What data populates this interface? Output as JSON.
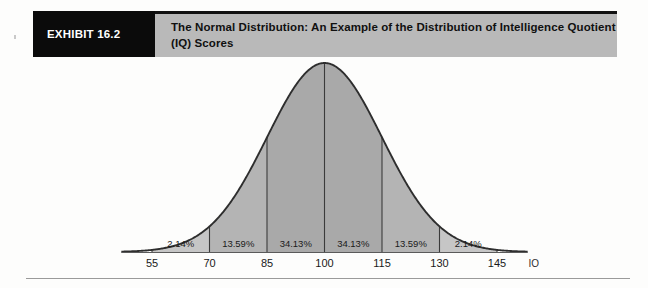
{
  "header": {
    "exhibit_tag": "EXHIBIT 16.2",
    "title": "The Normal Distribution: An Example of the Distribution of Intelligence Quotient (IQ) Scores",
    "tag_bg": "#0b0b0b",
    "title_bg": "#b9b9b9"
  },
  "chart_data": {
    "type": "area",
    "title": "The Normal Distribution: An Example of the Distribution of Intelligence Quotient (IQ) Scores",
    "xlabel": "IQ",
    "ylabel": "",
    "distribution": "normal",
    "mean": 100,
    "std_dev": 15,
    "xlim": [
      47,
      153
    ],
    "grid": false,
    "legend": false,
    "tick_labels": [
      "55",
      "70",
      "85",
      "100",
      "115",
      "130",
      "145"
    ],
    "tick_values": [
      55,
      70,
      85,
      100,
      115,
      130,
      145
    ],
    "band_labels": [
      "2.14%",
      "13.59%",
      "34.13%",
      "34.13%",
      "13.59%",
      "2.14%"
    ],
    "band_values": [
      2.14,
      13.59,
      34.13,
      34.13,
      13.59,
      2.14
    ],
    "band_ranges": [
      [
        55,
        70
      ],
      [
        70,
        85
      ],
      [
        85,
        100
      ],
      [
        100,
        115
      ],
      [
        115,
        130
      ],
      [
        130,
        145
      ]
    ],
    "band_colors": [
      "#c6c6c6",
      "#b4b4b4",
      "#a9a9a9",
      "#a9a9a9",
      "#b4b4b4",
      "#c6c6c6"
    ],
    "curve_color": "#2e2e2e",
    "axis_color": "#4a4a4a"
  },
  "axis": {
    "name": "IQ"
  }
}
